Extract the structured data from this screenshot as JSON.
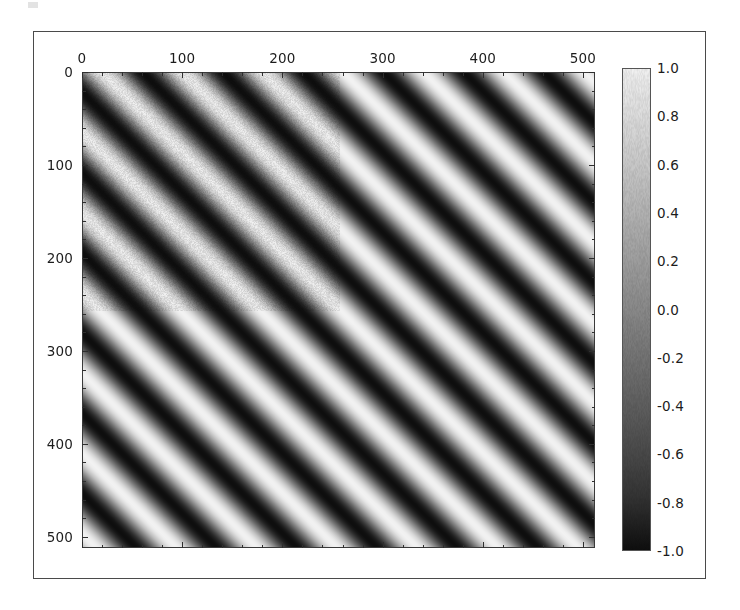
{
  "figure": {
    "background_color": "#ffffff",
    "frame_color": "#4a4a4a",
    "axes_color": "#3a3a3a",
    "text_color": "#1c1c1c"
  },
  "chart_data": {
    "type": "heatmap",
    "title": "",
    "subtitle": "",
    "xlabel": "",
    "ylabel": "",
    "grid": false,
    "legend_position": "right",
    "origin": "upper",
    "interpolation": "nearest",
    "colormap": "gray",
    "image_shape": [
      512,
      512
    ],
    "x": {
      "label": "",
      "position": "top",
      "range": [
        0,
        512
      ],
      "major_ticks": [
        0,
        100,
        200,
        300,
        400,
        500
      ],
      "major_tick_labels": [
        "0",
        "100",
        "200",
        "300",
        "400",
        "500"
      ],
      "minor_tick_interval": 20
    },
    "y": {
      "label": "",
      "position": "left",
      "range": [
        0,
        512
      ],
      "inverted": true,
      "major_ticks": [
        0,
        100,
        200,
        300,
        400,
        500
      ],
      "major_tick_labels": [
        "0",
        "100",
        "200",
        "300",
        "400",
        "500"
      ],
      "minor_tick_interval": 20
    },
    "colorbar": {
      "orientation": "vertical",
      "vmin": -1.0,
      "vmax": 1.0,
      "ticks": [
        1.0,
        0.8,
        0.6,
        0.4,
        0.2,
        0.0,
        -0.2,
        -0.4,
        -0.6,
        -0.8,
        -1.0
      ],
      "tick_labels": [
        "1.0",
        "0.8",
        "0.6",
        "0.4",
        "0.2",
        "0.0",
        "-0.2",
        "-0.4",
        "-0.6",
        "-0.8",
        "-1.0"
      ],
      "top_color": "#f2f2f2",
      "bottom_color": "#0e0e0e"
    },
    "pattern": {
      "form": "sin(2*pi*(fx*x + fy*y)) + noise",
      "orientation_degrees": 45,
      "stripe_direction": "lower-left to upper-right",
      "periods_across_width": 9,
      "amplitude": 1.0,
      "noise_level": 0.12
    }
  }
}
